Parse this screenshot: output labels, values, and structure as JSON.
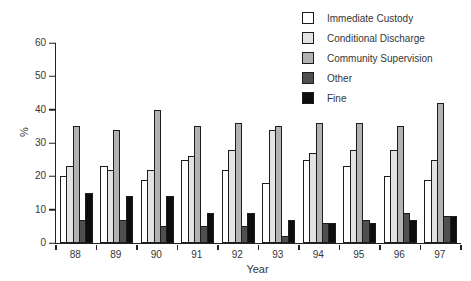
{
  "chart_data": {
    "type": "bar",
    "title": "",
    "xlabel": "Year",
    "ylabel": "%",
    "ylim": [
      0,
      60
    ],
    "yticks": [
      0,
      10,
      20,
      30,
      40,
      50,
      60
    ],
    "grid": false,
    "legend_position": "top-right",
    "bar_border_color": "#1c1c1c",
    "categories": [
      "88",
      "89",
      "90",
      "91",
      "92",
      "93",
      "94",
      "95",
      "96",
      "97"
    ],
    "series": [
      {
        "name": "Immediate Custody",
        "color": "#ffffff",
        "values": [
          20,
          23,
          19,
          25,
          22,
          18,
          25,
          23,
          20,
          19
        ]
      },
      {
        "name": "Conditional Discharge",
        "color": "#e3e3e3",
        "values": [
          23,
          22,
          22,
          26,
          28,
          34,
          27,
          28,
          28,
          25
        ]
      },
      {
        "name": "Community Supervision",
        "color": "#b2b2b2",
        "values": [
          35,
          34,
          40,
          35,
          36,
          35,
          36,
          36,
          35,
          42
        ]
      },
      {
        "name": "Other",
        "color": "#4f4f4f",
        "values": [
          7,
          7,
          5,
          5,
          5,
          2,
          6,
          7,
          9,
          8
        ]
      },
      {
        "name": "Fine",
        "color": "#0d0d0d",
        "values": [
          15,
          14,
          14,
          9,
          9,
          7,
          6,
          6,
          7,
          8
        ]
      }
    ]
  }
}
